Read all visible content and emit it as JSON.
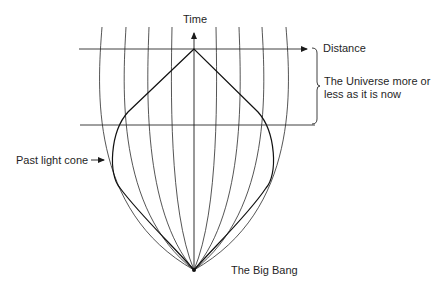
{
  "diagram": {
    "labels": {
      "time": "Time",
      "distance": "Distance",
      "universe_now_line1": "The Universe more or",
      "universe_now_line2": "less as it is now",
      "past_light_cone": "Past light cone",
      "big_bang": "The Big Bang"
    },
    "axes": {
      "vertical": "Time",
      "horizontal": "Distance"
    },
    "worldlines": {
      "count_left": 4,
      "count_right": 4,
      "central": true,
      "origin": "The Big Bang"
    },
    "colors": {
      "line": "#1a1a1a",
      "background": "#ffffff"
    }
  }
}
